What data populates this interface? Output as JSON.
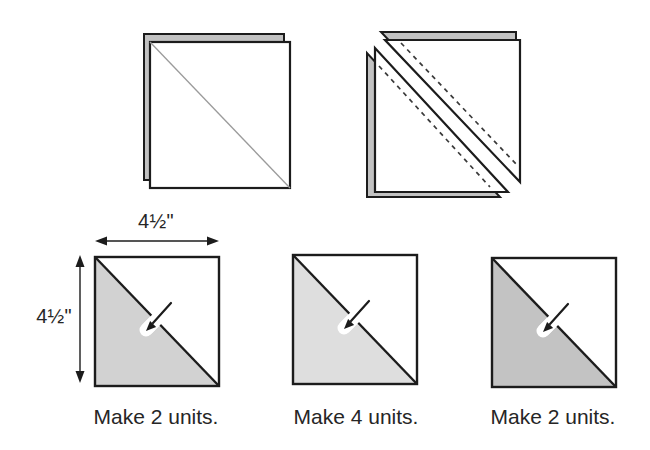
{
  "colors": {
    "background": "#ffffff",
    "outline": "#1c1c1c",
    "text": "#262626",
    "backing_fill": "#c2c2c2",
    "drawn_line_color": "#9b9b9b",
    "stitch_line_color": "#3a3a3a"
  },
  "dimensions": {
    "width_label": "4½\"",
    "height_label": "4½\""
  },
  "units": [
    {
      "caption": "Make 2 units.",
      "fill": "#d2d2d2"
    },
    {
      "caption": "Make 4 units.",
      "fill": "#dedede"
    },
    {
      "caption": "Make 2 units.",
      "fill": "#c3c3c3"
    }
  ],
  "icons": {
    "press_arrow": "press-direction-arrow-icon",
    "width_arrow": "width-dimension-arrow-icon",
    "height_arrow": "height-dimension-arrow-icon"
  }
}
